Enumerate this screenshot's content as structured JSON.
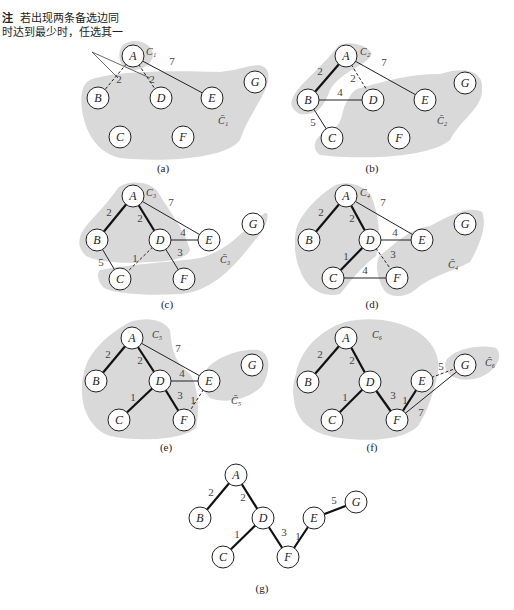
{
  "note": {
    "prefix": "注",
    "line1": "若出现两条备选边同",
    "line2": "时达到最少时，任选其一"
  },
  "colors": {
    "region": "#d9d9d9",
    "node_fill": "#ffffff",
    "stroke": "#222222",
    "tree_edge": "#111111"
  },
  "panels": [
    {
      "id": "a",
      "label": "(a)",
      "label_pos": [
        163,
        172
      ],
      "set_label": "C₁",
      "set_label_pos": [
        146,
        55
      ],
      "comp_label": "C̄₁",
      "comp_label_pos": [
        218,
        124
      ],
      "nodes": {
        "A": [
          133,
          56
        ],
        "B": [
          98,
          98
        ],
        "C": [
          120,
          137
        ],
        "D": [
          161,
          98
        ],
        "E": [
          212,
          98
        ],
        "F": [
          183,
          137
        ],
        "G": [
          255,
          82
        ]
      },
      "edges": [
        {
          "u": "A",
          "v": "B",
          "w": "2",
          "style": "dashed",
          "lp": [
            119,
            83
          ]
        },
        {
          "u": "A",
          "v": "D",
          "w": "2",
          "style": "dashed",
          "lp": [
            152,
            83
          ]
        },
        {
          "u": "A",
          "v": "E",
          "w": "7",
          "style": "thin",
          "lp": [
            172,
            65
          ]
        }
      ],
      "region": "M 90 80 C 110 72, 160 70, 220 72 C 245 70, 262 58, 268 72 C 272 90, 250 110, 240 140 C 225 160, 160 162, 120 158 C 95 152, 85 130, 82 110 C 80 95, 82 84, 90 80 Z",
      "subregion": "M 122 46 C 130 38, 146 40, 152 50 C 156 60, 146 70, 132 70 C 120 68, 116 56, 122 46 Z",
      "annotation_lines": [
        [
          [
            92,
            52
          ],
          [
            118,
            78
          ]
        ],
        [
          [
            92,
            52
          ],
          [
            150,
            78
          ]
        ]
      ]
    },
    {
      "id": "b",
      "label": "(b)",
      "label_pos": [
        372,
        172
      ],
      "set_label": "C₂",
      "set_label_pos": [
        360,
        55
      ],
      "comp_label": "C̄₂",
      "comp_label_pos": [
        437,
        124
      ],
      "nodes": {
        "A": [
          346,
          56
        ],
        "B": [
          308,
          100
        ],
        "C": [
          332,
          138
        ],
        "D": [
          373,
          100
        ],
        "E": [
          425,
          100
        ],
        "F": [
          399,
          138
        ],
        "G": [
          465,
          83
        ]
      },
      "edges": [
        {
          "u": "A",
          "v": "B",
          "w": "2",
          "style": "bold",
          "lp": [
            320,
            75
          ]
        },
        {
          "u": "A",
          "v": "D",
          "w": "2",
          "style": "dashed",
          "lp": [
            353,
            82
          ]
        },
        {
          "u": "A",
          "v": "E",
          "w": "7",
          "style": "thin",
          "lp": [
            384,
            66
          ]
        },
        {
          "u": "B",
          "v": "D",
          "w": "4",
          "style": "thin",
          "lp": [
            340,
            96
          ]
        },
        {
          "u": "B",
          "v": "C",
          "w": "5",
          "style": "thin",
          "lp": [
            313,
            126
          ]
        }
      ],
      "region": "M 360 88 C 390 80, 410 74, 440 74 C 465 66, 485 70, 482 92 C 480 110, 462 118, 450 140 C 430 158, 360 160, 320 155 C 310 148, 315 135, 330 130 C 345 125, 340 110, 348 100 C 352 92, 354 90, 360 88 Z",
      "subregion": "M 292 100 C 296 86, 320 70, 338 46 C 346 40, 368 44, 372 54 C 366 66, 340 72, 330 90 C 324 106, 318 116, 300 114 C 292 110, 290 104, 292 100 Z"
    },
    {
      "id": "c",
      "label": "(c)",
      "label_pos": [
        167,
        308
      ],
      "set_label": "C₃",
      "set_label_pos": [
        146,
        196
      ],
      "comp_label": "C̄₃",
      "comp_label_pos": [
        220,
        263
      ],
      "nodes": {
        "A": [
          133,
          196
        ],
        "B": [
          97,
          240
        ],
        "C": [
          120,
          279
        ],
        "D": [
          160,
          240
        ],
        "E": [
          209,
          240
        ],
        "F": [
          184,
          279
        ],
        "G": [
          253,
          224
        ]
      },
      "edges": [
        {
          "u": "A",
          "v": "B",
          "w": "2",
          "style": "bold",
          "lp": [
            109,
            216
          ]
        },
        {
          "u": "A",
          "v": "D",
          "w": "2",
          "style": "bold",
          "lp": [
            140,
            222
          ]
        },
        {
          "u": "A",
          "v": "E",
          "w": "7",
          "style": "thin",
          "lp": [
            171,
            206
          ]
        },
        {
          "u": "D",
          "v": "E",
          "w": "4",
          "style": "thin",
          "lp": [
            183,
            236
          ]
        },
        {
          "u": "D",
          "v": "F",
          "w": "3",
          "style": "thin",
          "lp": [
            180,
            256
          ]
        },
        {
          "u": "B",
          "v": "C",
          "w": "5",
          "style": "thin",
          "lp": [
            101,
            266
          ]
        },
        {
          "u": "D",
          "v": "C",
          "w": "1",
          "style": "dashed",
          "lp": [
            135,
            262
          ]
        }
      ],
      "region": "M 100 270 C 130 264, 175 262, 200 258 C 230 250, 245 228, 262 215 C 272 206, 268 228, 255 240 C 232 270, 210 292, 180 294 C 150 296, 115 294, 104 288 C 98 282, 96 274, 100 270 Z",
      "subregion": "M 80 238 C 82 226, 100 214, 118 188 C 126 180, 150 180, 158 192 C 168 210, 184 228, 190 250 C 188 258, 170 262, 150 262 C 120 264, 98 262, 86 256 C 80 250, 78 244, 80 238 Z"
    },
    {
      "id": "d",
      "label": "(d)",
      "label_pos": [
        372,
        308
      ],
      "set_label": "C₄",
      "set_label_pos": [
        360,
        196
      ],
      "comp_label": "C̄₄",
      "comp_label_pos": [
        448,
        268
      ],
      "nodes": {
        "A": [
          346,
          196
        ],
        "B": [
          309,
          240
        ],
        "C": [
          333,
          278
        ],
        "D": [
          370,
          240
        ],
        "E": [
          422,
          240
        ],
        "F": [
          397,
          278
        ],
        "G": [
          465,
          224
        ]
      },
      "edges": [
        {
          "u": "A",
          "v": "B",
          "w": "2",
          "style": "bold",
          "lp": [
            321,
            216
          ]
        },
        {
          "u": "A",
          "v": "D",
          "w": "2",
          "style": "bold",
          "lp": [
            352,
            222
          ]
        },
        {
          "u": "A",
          "v": "E",
          "w": "7",
          "style": "thin",
          "lp": [
            383,
            206
          ]
        },
        {
          "u": "D",
          "v": "E",
          "w": "4",
          "style": "thin",
          "lp": [
            395,
            236
          ]
        },
        {
          "u": "D",
          "v": "F",
          "w": "3",
          "style": "dashed",
          "lp": [
            393,
            258
          ]
        },
        {
          "u": "D",
          "v": "C",
          "w": "1",
          "style": "bold",
          "lp": [
            346,
            260
          ]
        },
        {
          "u": "C",
          "v": "F",
          "w": "4",
          "style": "thin",
          "lp": [
            365,
            274
          ]
        }
      ],
      "region": "M 380 255 C 392 248, 405 230, 430 226 C 450 215, 470 205, 482 212 C 488 226, 478 248, 470 262 C 452 272, 430 276, 415 290 C 405 298, 390 298, 384 290 C 378 280, 374 265, 380 255 Z",
      "subregion": "M 296 230 C 300 214, 318 196, 334 186 C 344 180, 366 184, 372 198 C 378 214, 382 236, 376 256 C 360 268, 350 282, 340 294 C 322 298, 306 288, 300 270 C 294 256, 294 242, 296 230 Z"
    },
    {
      "id": "e",
      "label": "(e)",
      "label_pos": [
        166,
        451
      ],
      "set_label": "C₅",
      "set_label_pos": [
        152,
        338
      ],
      "comp_label": "C̄₅",
      "comp_label_pos": [
        231,
        404
      ],
      "nodes": {
        "A": [
          132,
          338
        ],
        "B": [
          96,
          381
        ],
        "C": [
          119,
          420
        ],
        "D": [
          160,
          381
        ],
        "E": [
          209,
          381
        ],
        "F": [
          184,
          420
        ],
        "G": [
          252,
          365
        ]
      },
      "edges": [
        {
          "u": "A",
          "v": "B",
          "w": "2",
          "style": "bold",
          "lp": [
            108,
            358
          ]
        },
        {
          "u": "A",
          "v": "D",
          "w": "2",
          "style": "bold",
          "lp": [
            140,
            364
          ]
        },
        {
          "u": "A",
          "v": "E",
          "w": "7",
          "style": "thin",
          "lp": [
            178,
            352
          ]
        },
        {
          "u": "D",
          "v": "E",
          "w": "4",
          "style": "thin",
          "lp": [
            182,
            377
          ]
        },
        {
          "u": "D",
          "v": "C",
          "w": "1",
          "style": "bold",
          "lp": [
            133,
            401
          ]
        },
        {
          "u": "D",
          "v": "F",
          "w": "3",
          "style": "bold",
          "lp": [
            180,
            399
          ]
        },
        {
          "u": "E",
          "v": "F",
          "w": "1",
          "style": "dashed",
          "lp": [
            193,
            404
          ]
        }
      ],
      "region": "M 206 370 C 214 358, 240 348, 258 350 C 270 352, 272 370, 262 386 C 248 400, 226 404, 210 398 C 202 392, 200 380, 206 370 Z",
      "subregion": "M 84 374 C 86 356, 104 336, 130 322 C 148 316, 164 320, 170 330 C 172 346, 172 360, 190 374 C 198 386, 200 410, 196 428 C 182 440, 140 442, 110 436 C 92 430, 82 410, 82 392 C 82 384, 82 378, 84 374 Z"
    },
    {
      "id": "f",
      "label": "(f)",
      "label_pos": [
        372,
        451
      ],
      "set_label": "C₆",
      "set_label_pos": [
        372,
        338
      ],
      "comp_label": "C̄₆",
      "comp_label_pos": [
        485,
        366
      ],
      "nodes": {
        "A": [
          346,
          338
        ],
        "B": [
          308,
          382
        ],
        "C": [
          332,
          420
        ],
        "D": [
          370,
          382
        ],
        "E": [
          422,
          381
        ],
        "F": [
          397,
          420
        ],
        "G": [
          465,
          365
        ]
      },
      "edges": [
        {
          "u": "A",
          "v": "B",
          "w": "2",
          "style": "bold",
          "lp": [
            320,
            358
          ]
        },
        {
          "u": "A",
          "v": "D",
          "w": "2",
          "style": "bold",
          "lp": [
            352,
            364
          ]
        },
        {
          "u": "D",
          "v": "C",
          "w": "1",
          "style": "bold",
          "lp": [
            345,
            401
          ]
        },
        {
          "u": "D",
          "v": "F",
          "w": "3",
          "style": "bold",
          "lp": [
            393,
            399
          ]
        },
        {
          "u": "E",
          "v": "F",
          "w": "1",
          "style": "bold",
          "lp": [
            405,
            404
          ]
        },
        {
          "u": "E",
          "v": "G",
          "w": "5",
          "style": "dashed",
          "lp": [
            441,
            370
          ]
        },
        {
          "u": "F",
          "v": "G",
          "w": "7",
          "style": "thin",
          "lp": [
            421,
            416
          ]
        }
      ],
      "region": "M 448 358 C 458 348, 480 344, 496 348 C 504 356, 496 372, 478 378 C 462 382, 450 378, 446 370 C 444 364, 446 360, 448 358 Z",
      "subregion": "M 296 374 C 300 350, 320 330, 345 322 C 370 316, 398 320, 418 332 C 436 344, 440 360, 438 372 C 434 392, 428 410, 418 426 C 404 440, 370 442, 340 438 C 310 434, 296 420, 294 400 C 292 388, 294 380, 296 374 Z"
    },
    {
      "id": "g",
      "label": "(g)",
      "label_pos": [
        262,
        592
      ],
      "nodes": {
        "A": [
          236,
          475
        ],
        "B": [
          200,
          518
        ],
        "C": [
          223,
          557
        ],
        "D": [
          263,
          518
        ],
        "E": [
          314,
          518
        ],
        "F": [
          288,
          557
        ],
        "G": [
          356,
          502
        ]
      },
      "edges": [
        {
          "u": "A",
          "v": "B",
          "w": "2",
          "style": "bold",
          "lp": [
            211,
            496
          ]
        },
        {
          "u": "A",
          "v": "D",
          "w": "2",
          "style": "bold",
          "lp": [
            243,
            501
          ]
        },
        {
          "u": "D",
          "v": "C",
          "w": "1",
          "style": "bold",
          "lp": [
            237,
            538
          ]
        },
        {
          "u": "D",
          "v": "F",
          "w": "3",
          "style": "bold",
          "lp": [
            284,
            536
          ]
        },
        {
          "u": "E",
          "v": "F",
          "w": "1",
          "style": "bold",
          "lp": [
            298,
            540
          ]
        },
        {
          "u": "E",
          "v": "G",
          "w": "5",
          "style": "bold",
          "lp": [
            334,
            504
          ]
        }
      ]
    }
  ]
}
